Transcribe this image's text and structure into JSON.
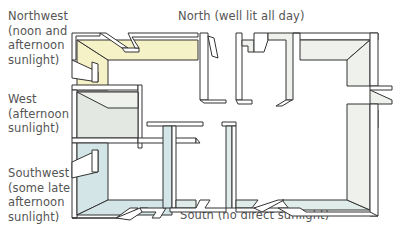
{
  "diagram": {
    "type": "floor-plan-orientation",
    "labels": {
      "northwest": "Northwest\n(noon and\nafternoon\nsunlight)",
      "north": "North (well lit all day)",
      "west": "West\n(afternoon\nsunlight)",
      "southwest": "Southwest\n(some late\nafternoon\nsunlight)",
      "south": "South (no direct sunlight)"
    },
    "colors": {
      "northwest_wall": "#f6f2c8",
      "north_wall": "#eef1ec",
      "west_wall": "#e3e9e2",
      "southwest_wall": "#d4e5e8",
      "south_wall": "#dfece9",
      "outline": "#333333",
      "text": "#555555"
    }
  }
}
